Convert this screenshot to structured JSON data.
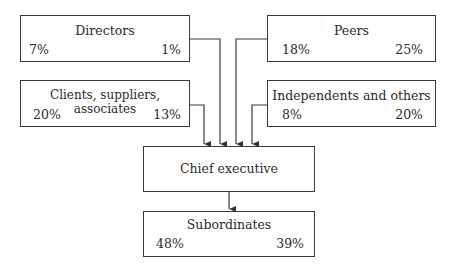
{
  "diagram": {
    "boxes": {
      "directors": {
        "label": "Directors",
        "left_value": "7%",
        "right_value": "1%"
      },
      "peers": {
        "label": "Peers",
        "left_value": "18%",
        "right_value": "25%"
      },
      "clients": {
        "label": "Clients, suppliers, associates",
        "left_value": "20%",
        "right_value": "13%"
      },
      "independents": {
        "label": "Independents and others",
        "left_value": "8%",
        "right_value": "20%"
      },
      "chief": {
        "label": "Chief executive"
      },
      "subordinates": {
        "label": "Subordinates",
        "left_value": "48%",
        "right_value": "39%"
      }
    },
    "edges": [
      {
        "from": "directors",
        "to": "chief"
      },
      {
        "from": "peers",
        "to": "chief"
      },
      {
        "from": "clients",
        "to": "chief"
      },
      {
        "from": "independents",
        "to": "chief"
      },
      {
        "from": "chief",
        "to": "subordinates"
      }
    ]
  }
}
